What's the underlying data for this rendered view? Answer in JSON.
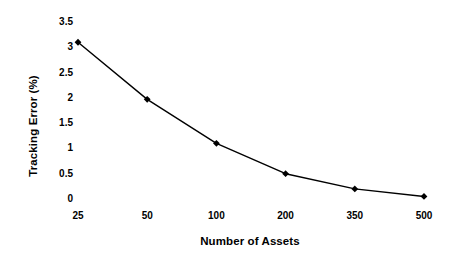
{
  "chart_data": {
    "type": "line",
    "title": "",
    "subtitle": "",
    "xlabel": "Number of Assets",
    "ylabel": "Tracking Error (%)",
    "categories": [
      "25",
      "50",
      "100",
      "200",
      "350",
      "500"
    ],
    "values": [
      3.1,
      1.97,
      1.1,
      0.5,
      0.2,
      0.05
    ],
    "series": [
      {
        "name": "Tracking Error",
        "values": [
          3.1,
          1.97,
          1.1,
          0.5,
          0.2,
          0.05
        ]
      }
    ],
    "ylim": [
      0,
      3.5
    ],
    "ytick_labels": [
      "3.5",
      "3",
      "2.5",
      "2",
      "1.5",
      "1",
      "0.5",
      "0"
    ],
    "ytick_values": [
      3.5,
      3,
      2.5,
      2,
      1.5,
      1,
      0.5,
      0
    ],
    "grid": false,
    "axis_lines": false,
    "legend": false,
    "legend_position": "none",
    "marker": "diamond",
    "line_color": "#000000",
    "marker_color": "#000000",
    "background_color": "#ffffff"
  }
}
